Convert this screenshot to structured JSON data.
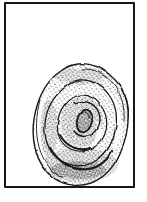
{
  "figure": {
    "description": "Hand-drawn pen sketch of a coiled spiral, rose-like form shaded with dense stippling, centered low inside a hand-ruled rectangular frame on white paper",
    "subject_label": "spiral-coil-sketch"
  },
  "palette": {
    "paper": "#ffffff",
    "ink": "#1a1a1a",
    "stipple": "#2e2e2e",
    "frame": "#161616"
  }
}
